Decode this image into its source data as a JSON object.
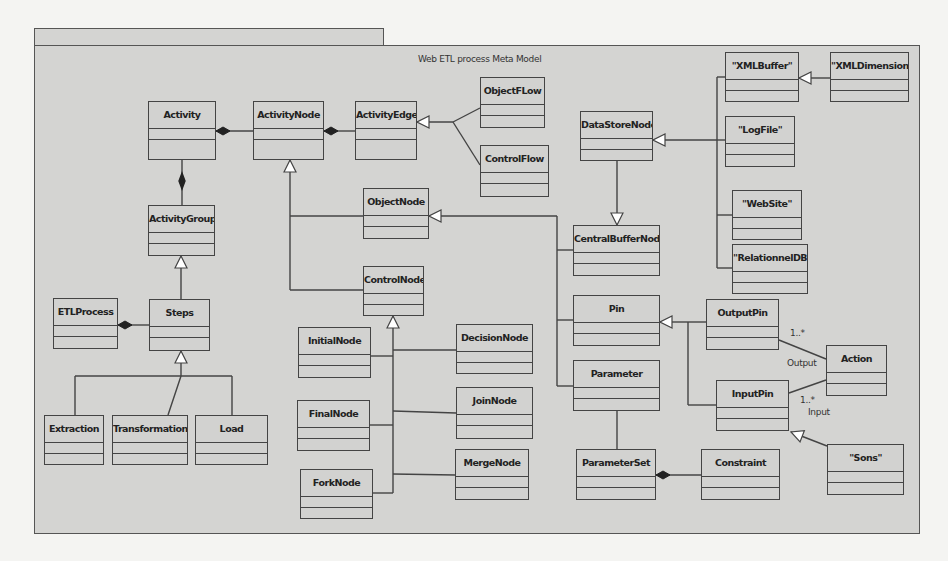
{
  "diagram": {
    "title": "Web ETL process Meta Model",
    "type": "UML class diagram"
  },
  "classes": {
    "activity": "Activity",
    "activity_node": "ActivityNode",
    "activity_edge": "ActivityEdge",
    "object_flow": "ObjectFLow",
    "control_flow": "ControlFlow",
    "object_node": "ObjectNode",
    "activity_group": "ActivityGroup",
    "control_node": "ControlNode",
    "etl_process": "ETLProcess",
    "steps": "Steps",
    "initial_node": "InitialNode",
    "decision_node": "DecisionNode",
    "final_node": "FinalNode",
    "join_node": "JoinNode",
    "fork_node": "ForkNode",
    "merge_node": "MergeNode",
    "extraction": "Extraction",
    "transformation": "Transformation",
    "load": "Load",
    "data_store_node": "DataStoreNode",
    "central_buffer_node": "CentralBufferNode",
    "pin": "Pin",
    "parameter": "Parameter",
    "parameter_set": "ParameterSet",
    "constraint": "Constraint",
    "xml_buffer": "\"XMLBuffer\"",
    "xml_dimension": "\"XMLDimension\"",
    "log_file": "\"LogFile\"",
    "web_site": "\"WebSite\"",
    "relationnel_db": "\"RelationnelDB\"",
    "output_pin": "OutputPin",
    "input_pin": "InputPin",
    "action": "Action",
    "sons": "\"Sons\""
  },
  "association_labels": {
    "output_multiplicity": "1..*",
    "output_role": "Output",
    "input_multiplicity": "1..*",
    "input_role": "Input"
  },
  "relationships": [
    {
      "from": "ActivityNode",
      "to": "Activity",
      "kind": "composition"
    },
    {
      "from": "ActivityEdge",
      "to": "ActivityNode",
      "kind": "composition"
    },
    {
      "from": "ActivityGroup",
      "to": "Activity",
      "kind": "composition"
    },
    {
      "from": "ObjectFLow",
      "to": "ActivityEdge",
      "kind": "generalization"
    },
    {
      "from": "ControlFlow",
      "to": "ActivityEdge",
      "kind": "generalization"
    },
    {
      "from": "ObjectNode",
      "to": "ActivityNode",
      "kind": "generalization"
    },
    {
      "from": "ControlNode",
      "to": "ActivityNode",
      "kind": "generalization"
    },
    {
      "from": "Steps",
      "to": "ActivityGroup",
      "kind": "generalization"
    },
    {
      "from": "Steps",
      "to": "ETLProcess",
      "kind": "composition"
    },
    {
      "from": "Extraction",
      "to": "Steps",
      "kind": "generalization"
    },
    {
      "from": "Transformation",
      "to": "Steps",
      "kind": "generalization"
    },
    {
      "from": "Load",
      "to": "Steps",
      "kind": "generalization"
    },
    {
      "from": "InitialNode",
      "to": "ControlNode",
      "kind": "generalization"
    },
    {
      "from": "FinalNode",
      "to": "ControlNode",
      "kind": "generalization"
    },
    {
      "from": "ForkNode",
      "to": "ControlNode",
      "kind": "generalization"
    },
    {
      "from": "DecisionNode",
      "to": "ControlNode",
      "kind": "generalization"
    },
    {
      "from": "JoinNode",
      "to": "ControlNode",
      "kind": "generalization"
    },
    {
      "from": "MergeNode",
      "to": "ControlNode",
      "kind": "generalization"
    },
    {
      "from": "CentralBufferNode",
      "to": "ObjectNode",
      "kind": "generalization"
    },
    {
      "from": "Pin",
      "to": "ObjectNode",
      "kind": "generalization"
    },
    {
      "from": "Parameter",
      "to": "ObjectNode",
      "kind": "generalization"
    },
    {
      "from": "DataStoreNode",
      "to": "CentralBufferNode",
      "kind": "generalization"
    },
    {
      "from": "\"XMLBuffer\"",
      "to": "DataStoreNode",
      "kind": "generalization"
    },
    {
      "from": "\"LogFile\"",
      "to": "DataStoreNode",
      "kind": "generalization"
    },
    {
      "from": "\"WebSite\"",
      "to": "DataStoreNode",
      "kind": "generalization"
    },
    {
      "from": "\"RelationnelDB\"",
      "to": "DataStoreNode",
      "kind": "generalization"
    },
    {
      "from": "\"XMLDimension\"",
      "to": "\"XMLBuffer\"",
      "kind": "generalization"
    },
    {
      "from": "OutputPin",
      "to": "Pin",
      "kind": "generalization"
    },
    {
      "from": "InputPin",
      "to": "Pin",
      "kind": "generalization"
    },
    {
      "from": "\"Sons\"",
      "to": "InputPin",
      "kind": "generalization"
    },
    {
      "from": "Parameter",
      "to": "ParameterSet",
      "kind": "association"
    },
    {
      "from": "Constraint",
      "to": "ParameterSet",
      "kind": "composition"
    },
    {
      "from": "Action",
      "to": "OutputPin",
      "kind": "association",
      "role": "Output",
      "multiplicity": "1..*"
    },
    {
      "from": "Action",
      "to": "InputPin",
      "kind": "association",
      "role": "Input",
      "multiplicity": "1..*"
    }
  ]
}
